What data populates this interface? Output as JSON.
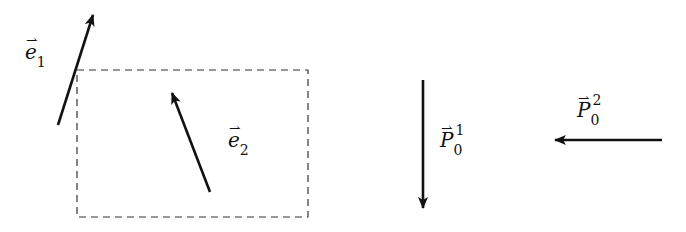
{
  "diagram": {
    "colors": {
      "stroke": "#111111",
      "background": "#ffffff"
    },
    "frame": {
      "type": "dashed-rectangle",
      "x": 77,
      "y": 70,
      "width": 231,
      "height": 147
    },
    "vectors": [
      {
        "id": "e1",
        "tail": [
          58,
          125
        ],
        "head": [
          93,
          15
        ]
      },
      {
        "id": "e2",
        "tail": [
          210,
          192
        ],
        "head": [
          172,
          93
        ]
      },
      {
        "id": "P0_1",
        "tail": [
          423,
          80
        ],
        "head": [
          423,
          208
        ]
      },
      {
        "id": "P0_2",
        "tail": [
          662,
          140
        ],
        "head": [
          555,
          140
        ]
      }
    ],
    "labels": {
      "e1": {
        "arrow": "⇀",
        "base": "e",
        "sub": "1",
        "sup": ""
      },
      "e2": {
        "arrow": "⇀",
        "base": "e",
        "sub": "2",
        "sup": ""
      },
      "P0_1": {
        "arrow": "⇀",
        "base": "P",
        "sub": "0",
        "sup": "1"
      },
      "P0_2": {
        "arrow": "⇀",
        "base": "P",
        "sub": "0",
        "sup": "2"
      }
    }
  }
}
